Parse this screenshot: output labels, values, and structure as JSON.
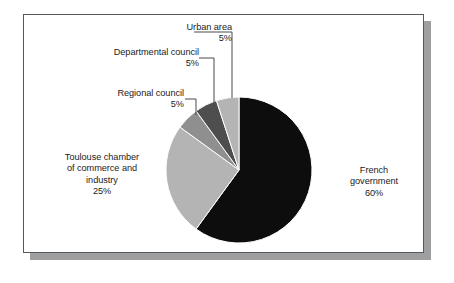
{
  "figure": {
    "background_color": "#ffffff",
    "frame_border_color": "#55585c",
    "frame_shadow_color": "#9d9fa1"
  },
  "chart_data": {
    "type": "pie",
    "title": "",
    "subtitle": "",
    "xlabel": "",
    "ylabel": "",
    "legend_position": "none",
    "grid": false,
    "units": "percent",
    "total": 100,
    "start_angle_deg": 0,
    "direction": "clockwise",
    "categories": [
      "French government",
      "Toulouse chamber of commerce and industry",
      "Regional council",
      "Departmental council",
      "Urban area"
    ],
    "values": [
      60,
      25,
      5,
      5,
      5
    ],
    "value_labels": [
      "60%",
      "25%",
      "5%",
      "5%",
      "5%"
    ],
    "colors": [
      "#0d0d0d",
      "#b4b4b4",
      "#8f8f8f",
      "#4e4e4e",
      "#b4b4b4"
    ],
    "slices": [
      {
        "name": "French government",
        "value": 60,
        "value_label": "60%",
        "color": "#0d0d0d",
        "label_lines": "French\ngovernment\n60%"
      },
      {
        "name": "Toulouse chamber of commerce and industry",
        "value": 25,
        "value_label": "25%",
        "color": "#b4b4b4",
        "label_lines": "Toulouse chamber\nof commerce and\nindustry\n25%"
      },
      {
        "name": "Regional council",
        "value": 5,
        "value_label": "5%",
        "color": "#8f8f8f",
        "label_lines": "Regional council\n5%"
      },
      {
        "name": "Departmental council",
        "value": 5,
        "value_label": "5%",
        "color": "#4e4e4e",
        "label_lines": "Departmental council\n5%"
      },
      {
        "name": "Urban area",
        "value": 5,
        "value_label": "5%",
        "color": "#b4b4b4",
        "label_lines": "Urban area\n5%"
      }
    ]
  },
  "labels": {
    "urban_area": "Urban area\n5%",
    "departmental_council": "Departmental council\n5%",
    "regional_council": "Regional council\n5%",
    "toulouse_chamber": "Toulouse chamber\nof commerce and\nindustry\n25%",
    "french_government": "French\ngovernment\n60%"
  }
}
